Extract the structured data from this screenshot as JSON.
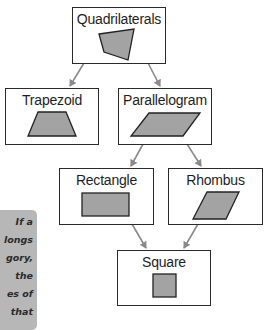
{
  "diagram": {
    "type": "hierarchy",
    "nodes": [
      {
        "id": "quadrilaterals",
        "label": "Quadrilaterals",
        "shape": "irregular-quadrilateral"
      },
      {
        "id": "trapezoid",
        "label": "Trapezoid",
        "shape": "trapezoid"
      },
      {
        "id": "parallelogram",
        "label": "Parallelogram",
        "shape": "parallelogram"
      },
      {
        "id": "rectangle",
        "label": "Rectangle",
        "shape": "rectangle"
      },
      {
        "id": "rhombus",
        "label": "Rhombus",
        "shape": "rhombus"
      },
      {
        "id": "square",
        "label": "Square",
        "shape": "square"
      }
    ],
    "edges": [
      {
        "from": "quadrilaterals",
        "to": "trapezoid"
      },
      {
        "from": "quadrilaterals",
        "to": "parallelogram"
      },
      {
        "from": "parallelogram",
        "to": "rectangle"
      },
      {
        "from": "parallelogram",
        "to": "rhombus"
      },
      {
        "from": "rectangle",
        "to": "square"
      },
      {
        "from": "rhombus",
        "to": "square"
      }
    ]
  },
  "note": {
    "lines": [
      "If a",
      "longs",
      "gory,",
      "the",
      "es of",
      "that"
    ]
  },
  "colors": {
    "shape_fill": "#a3a3a3",
    "shape_stroke": "#222222",
    "arrow": "#8a8a8a",
    "note_bg": "#b7b7b7"
  }
}
